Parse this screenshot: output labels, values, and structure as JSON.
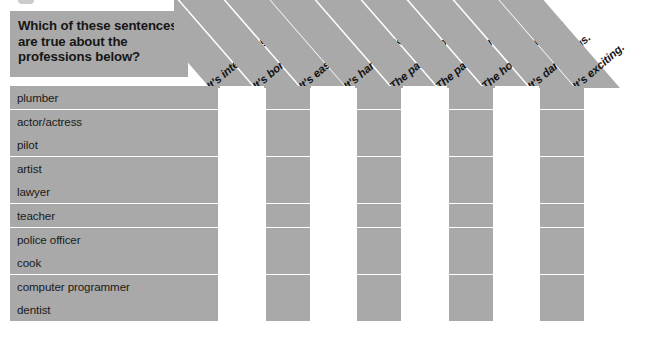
{
  "worksheet": {
    "question": "Which of these sentences\nare true about the\nprofessions below?",
    "colors": {
      "shade": "#a9a9a9",
      "background": "#ffffff",
      "text": "#1a1a1a"
    },
    "columns": [
      {
        "label": "It's interesting.",
        "shaded": true
      },
      {
        "label": "It's boring.",
        "shaded": true
      },
      {
        "label": "It's easy.",
        "shaded": true
      },
      {
        "label": "It's hard work.",
        "shaded": true
      },
      {
        "label": "The pay is good.",
        "shaded": true
      },
      {
        "label": "The pay is terrible.",
        "shaded": true
      },
      {
        "label": "The hours are long.",
        "shaded": true
      },
      {
        "label": "It's dangerous.",
        "shaded": true
      },
      {
        "label": "It's exciting.",
        "shaded": true
      }
    ],
    "rows": [
      {
        "label": "plumber"
      },
      {
        "label": "actor/actress"
      },
      {
        "label": "pilot"
      },
      {
        "label": "artist"
      },
      {
        "label": "lawyer"
      },
      {
        "label": "teacher"
      },
      {
        "label": "police officer"
      },
      {
        "label": "cook"
      },
      {
        "label": "computer programmer"
      },
      {
        "label": "dentist"
      }
    ],
    "cell_pattern": [
      [
        1,
        0,
        1,
        0,
        1,
        0,
        1,
        0,
        1
      ],
      [
        1,
        0,
        1,
        0,
        1,
        0,
        1,
        0,
        1
      ],
      [
        1,
        0,
        1,
        0,
        1,
        0,
        1,
        0,
        1
      ],
      [
        1,
        0,
        1,
        0,
        1,
        0,
        1,
        0,
        1
      ],
      [
        1,
        0,
        1,
        0,
        1,
        0,
        1,
        0,
        1
      ],
      [
        1,
        0,
        1,
        0,
        1,
        0,
        1,
        0,
        1
      ],
      [
        1,
        0,
        1,
        0,
        1,
        0,
        1,
        0,
        1
      ],
      [
        1,
        0,
        1,
        0,
        1,
        0,
        1,
        0,
        1
      ],
      [
        1,
        0,
        1,
        0,
        1,
        0,
        1,
        0,
        1
      ],
      [
        1,
        0,
        1,
        0,
        1,
        0,
        1,
        0,
        1
      ]
    ]
  }
}
